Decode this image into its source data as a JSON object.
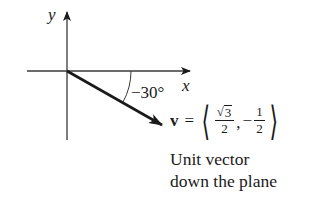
{
  "figure": {
    "axes": {
      "x_label": "x",
      "y_label": "y"
    },
    "angle_label": "−30°",
    "vector": {
      "name": "v",
      "equals": "=",
      "open_bracket": "⟨",
      "close_bracket": "⟩",
      "x_component": {
        "sign": "",
        "radical_sign": "√",
        "radicand": "3",
        "denominator": "2"
      },
      "separator": ",",
      "y_component": {
        "sign": "−",
        "numerator": "1",
        "denominator": "2"
      }
    },
    "caption": {
      "line1": "Unit vector",
      "line2": "down the plane"
    },
    "geometry": {
      "origin": [
        67,
        71
      ],
      "angle_degrees": -30
    },
    "colors": {
      "ink": "#1a1a1a",
      "background": "#ffffff"
    }
  }
}
